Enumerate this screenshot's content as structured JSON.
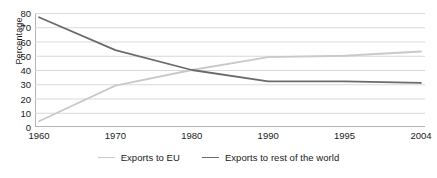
{
  "chart_data": {
    "type": "line",
    "title": "",
    "subtitle": "",
    "xlabel": "",
    "ylabel": "Percentage",
    "categories": [
      "1960",
      "1970",
      "1980",
      "1990",
      "1995",
      "2004"
    ],
    "ylim": [
      0,
      80
    ],
    "ytick_step": 10,
    "yticks": [
      "80",
      "70",
      "60",
      "50",
      "40",
      "30",
      "20",
      "10",
      "0"
    ],
    "grid": "horizontal",
    "legend_position": "bottom-center",
    "series": [
      {
        "name": "Exports to EU",
        "color": "#c9c9c9",
        "values": [
          4,
          29,
          40,
          49,
          50,
          53
        ]
      },
      {
        "name": "Exports to rest of the world",
        "color": "#6b6b6b",
        "values": [
          77,
          54,
          40,
          32,
          32,
          31
        ]
      }
    ],
    "annotations": []
  },
  "legend": {
    "items": [
      {
        "label": "Exports to EU",
        "color": "#c9c9c9"
      },
      {
        "label": "Exports to rest of the world",
        "color": "#6b6b6b"
      }
    ]
  },
  "colors": {
    "gridline": "#d9d9d9",
    "axis": "#b4b4b4",
    "background": "#ffffff",
    "text": "#1a1a1a"
  }
}
